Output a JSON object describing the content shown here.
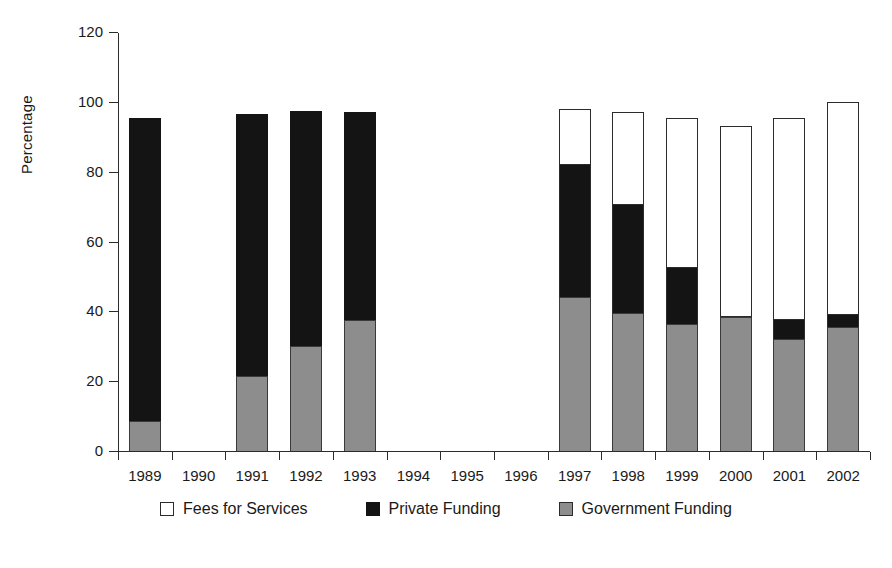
{
  "chart_data": {
    "type": "bar",
    "subtype": "stacked-bar",
    "title": "",
    "xlabel": "",
    "ylabel": "Percentage",
    "ylim": [
      0,
      120
    ],
    "yticks": [
      0,
      20,
      40,
      60,
      80,
      100,
      120
    ],
    "grid": false,
    "legend_position": "bottom",
    "categories": [
      "1989",
      "1990",
      "1991",
      "1992",
      "1993",
      "1994",
      "1995",
      "1996",
      "1997",
      "1998",
      "1999",
      "2000",
      "2001",
      "2002"
    ],
    "series": [
      {
        "name": "Government Funding",
        "color": "#8d8d8d",
        "values": [
          8.5,
          0,
          21.5,
          30,
          37.5,
          0,
          0,
          0,
          44,
          39.5,
          36.5,
          38.5,
          32,
          35.5
        ]
      },
      {
        "name": "Private Funding",
        "color": "#141414",
        "values": [
          87,
          0,
          75,
          67.5,
          59.5,
          0,
          0,
          0,
          38,
          31,
          16,
          0,
          5.5,
          3.5
        ]
      },
      {
        "name": "Fees for Services",
        "color": "#ffffff",
        "values": [
          0,
          0,
          0,
          0,
          0,
          0,
          0,
          0,
          16,
          26.5,
          43,
          54.5,
          58,
          61
        ]
      }
    ],
    "totals": [
      95.5,
      0,
      96.5,
      97.5,
      97,
      0,
      0,
      0,
      98,
      97,
      95.5,
      93,
      95.5,
      100
    ]
  },
  "legend": {
    "items": [
      {
        "label": "Fees for Services",
        "swatch": "white-square-icon"
      },
      {
        "label": "Private Funding",
        "swatch": "black-square-icon"
      },
      {
        "label": "Government Funding",
        "swatch": "gray-square-icon"
      }
    ]
  }
}
